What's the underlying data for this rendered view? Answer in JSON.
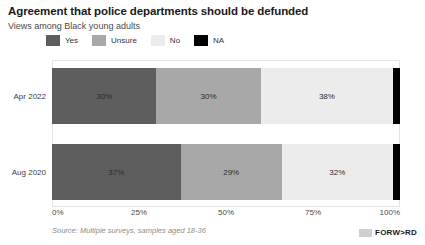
{
  "header": {
    "title": "Agreement that police departments should be defunded",
    "subtitle": "Views among Black young adults"
  },
  "legend": {
    "position": "top",
    "items": [
      {
        "label": "Yes",
        "color": "#5e5e5e"
      },
      {
        "label": "Unsure",
        "color": "#a8a8a8"
      },
      {
        "label": "No",
        "color": "#ececec"
      },
      {
        "label": "NA",
        "color": "#000000"
      }
    ]
  },
  "footer": {
    "source": "Source: Multiple surveys, samples aged 18-36",
    "brand": "FORW>RD",
    "brand_mark": "square-logo-icon"
  },
  "chart_data": {
    "type": "bar",
    "orientation": "horizontal",
    "stacked": true,
    "normalized": true,
    "title": "Agreement that police departments should be defunded",
    "subtitle": "Views among Black young adults",
    "xlabel": "",
    "ylabel": "",
    "xlim": [
      0,
      100
    ],
    "xticks": [
      "0%",
      "25%",
      "50%",
      "75%",
      "100%"
    ],
    "xtick_values": [
      0,
      25,
      50,
      75,
      100
    ],
    "grid": false,
    "legend_position": "top",
    "categories": [
      "Apr 2022",
      "Aug 2020"
    ],
    "series": [
      {
        "name": "Yes",
        "color": "#5e5e5e",
        "values": [
          30,
          37
        ],
        "labels": [
          "30%",
          "37%"
        ]
      },
      {
        "name": "Unsure",
        "color": "#a8a8a8",
        "values": [
          30,
          29
        ],
        "labels": [
          "30%",
          "29%"
        ]
      },
      {
        "name": "No",
        "color": "#ececec",
        "values": [
          38,
          32
        ],
        "labels": [
          "38%",
          "32%"
        ]
      },
      {
        "name": "NA",
        "color": "#000000",
        "values": [
          2,
          2
        ],
        "labels": [
          "",
          ""
        ]
      }
    ],
    "rows": [
      {
        "category": "Apr 2022",
        "segments": [
          {
            "name": "Yes",
            "value": 30,
            "label": "30%",
            "color": "#5e5e5e",
            "show_label": true
          },
          {
            "name": "Unsure",
            "value": 30,
            "label": "30%",
            "color": "#a8a8a8",
            "show_label": true
          },
          {
            "name": "No",
            "value": 38,
            "label": "38%",
            "color": "#ececec",
            "show_label": true
          },
          {
            "name": "NA",
            "value": 2,
            "label": "2%",
            "color": "#000000",
            "show_label": false
          }
        ]
      },
      {
        "category": "Aug 2020",
        "segments": [
          {
            "name": "Yes",
            "value": 37,
            "label": "37%",
            "color": "#5e5e5e",
            "show_label": true
          },
          {
            "name": "Unsure",
            "value": 29,
            "label": "29%",
            "color": "#a8a8a8",
            "show_label": true
          },
          {
            "name": "No",
            "value": 32,
            "label": "32%",
            "color": "#ececec",
            "show_label": true
          },
          {
            "name": "NA",
            "value": 2,
            "label": "2%",
            "color": "#000000",
            "show_label": false
          }
        ]
      }
    ]
  }
}
